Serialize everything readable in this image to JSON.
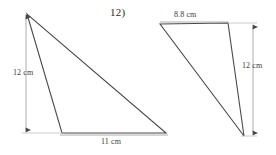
{
  "page": {
    "background_color": "#ffffff",
    "stroke_color": "#4a4a4a",
    "dimension_stroke_color": "#8a8a8a",
    "text_color": "#2b2b2b",
    "width": 276,
    "height": 155
  },
  "problems": [
    {
      "id": "problem-11",
      "number_label": ")",
      "shape": "triangle",
      "description": "obtuse scalene triangle with vertical height dimension on the left and horizontal base dimension below",
      "vertices": [
        {
          "name": "apex",
          "x": 27,
          "y": 14
        },
        {
          "name": "bottom-left",
          "x": 62,
          "y": 133
        },
        {
          "name": "bottom-right",
          "x": 166,
          "y": 133
        }
      ],
      "dimensions": [
        {
          "name": "height",
          "label": "12 cm",
          "value": 12,
          "unit": "cm",
          "orientation": "vertical",
          "line": {
            "x1": 26,
            "y1": 14,
            "x2": 26,
            "y2": 133
          }
        },
        {
          "name": "base",
          "label": "11 cm",
          "value": 11,
          "unit": "cm",
          "orientation": "horizontal",
          "line": {
            "x1": 62,
            "y1": 135,
            "x2": 166,
            "y2": 135
          }
        }
      ]
    },
    {
      "id": "problem-12",
      "number_label": "12)",
      "shape": "triangle",
      "description": "obtuse scalene triangle with horizontal top dimension and vertical height dimension on the right",
      "vertices": [
        {
          "name": "top-left",
          "x": 160,
          "y": 24
        },
        {
          "name": "top-right",
          "x": 228,
          "y": 23
        },
        {
          "name": "bottom",
          "x": 244,
          "y": 136
        }
      ],
      "dimensions": [
        {
          "name": "top-side",
          "label": "8.8 cm",
          "value": 8.8,
          "unit": "cm",
          "orientation": "horizontal",
          "line": {
            "x1": 160,
            "y1": 22,
            "x2": 228,
            "y2": 22
          }
        },
        {
          "name": "height",
          "label": "12 cm",
          "value": 12,
          "unit": "cm",
          "orientation": "vertical",
          "line": {
            "x1": 253,
            "y1": 24,
            "x2": 253,
            "y2": 136
          }
        }
      ]
    }
  ],
  "labels": {
    "problem_11_number": ")",
    "problem_12_number": "12)",
    "left_height": "12 cm",
    "left_base": "11 cm",
    "right_top": "8.8 cm",
    "right_height": "12 cm"
  }
}
